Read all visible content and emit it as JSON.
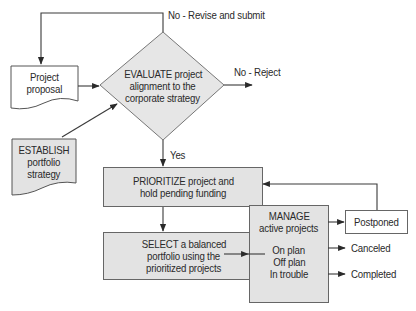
{
  "diagram": {
    "type": "flowchart",
    "colors": {
      "box_fill": "#e3e3e3",
      "doc_fill": "#ffffff",
      "line": "#3a3a3a",
      "text": "#2a2a2a"
    },
    "nodes": {
      "proposal": {
        "shape": "document",
        "lines": [
          "Project",
          "proposal"
        ]
      },
      "establish": {
        "shape": "document",
        "lines": [
          "ESTABLISH",
          "portfolio",
          "strategy"
        ]
      },
      "evaluate": {
        "shape": "diamond",
        "lines": [
          "EVALUATE project",
          "alignment to the",
          "corporate strategy"
        ]
      },
      "prioritize": {
        "shape": "rectangle",
        "lines": [
          "PRIORITIZE project and",
          "hold pending funding"
        ]
      },
      "select": {
        "shape": "rectangle",
        "lines": [
          "SELECT a balanced",
          "portfolio using the",
          "prioritized projects"
        ]
      },
      "manage": {
        "shape": "rectangle",
        "lines": [
          "MANAGE",
          "active projects",
          "",
          "On plan",
          "Off plan",
          "In trouble"
        ]
      },
      "postponed": {
        "shape": "rectangle",
        "lines": [
          "Postponed"
        ]
      }
    },
    "edge_labels": {
      "revise": "No - Revise and submit",
      "reject": "No - Reject",
      "yes": "Yes",
      "canceled": "Canceled",
      "completed": "Completed"
    },
    "edges": [
      {
        "from": "evaluate",
        "to": "proposal",
        "label": "No - Revise and submit"
      },
      {
        "from": "proposal",
        "to": "evaluate"
      },
      {
        "from": "establish",
        "to": "evaluate"
      },
      {
        "from": "evaluate",
        "to": "reject",
        "label": "No - Reject"
      },
      {
        "from": "evaluate",
        "to": "prioritize",
        "label": "Yes"
      },
      {
        "from": "prioritize",
        "to": "select"
      },
      {
        "from": "select",
        "to": "manage"
      },
      {
        "from": "manage",
        "to": "postponed"
      },
      {
        "from": "postponed",
        "to": "prioritize"
      },
      {
        "from": "manage",
        "to": "canceled",
        "label": "Canceled"
      },
      {
        "from": "manage",
        "to": "completed",
        "label": "Completed"
      }
    ]
  }
}
